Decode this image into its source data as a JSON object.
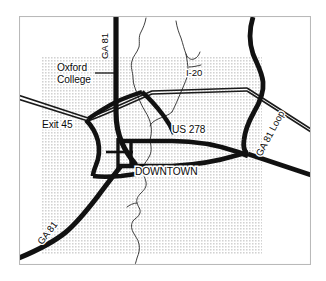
{
  "map": {
    "title": "Downtown Covington / Oxford area road map",
    "background_color": "#ffffff",
    "frame_color": "#b9b9b9",
    "urban_fill_color": "#d9d9d9",
    "road_color": "#111111",
    "river_color": "#2a2a2a",
    "labels": [
      {
        "id": "ga81-north",
        "text": "GA 81",
        "kind": "highway-shield-text",
        "x": 108,
        "y": 46,
        "rotation": -90
      },
      {
        "id": "oxford-college",
        "text": "Oxford",
        "kind": "place",
        "x": 57,
        "y": 71,
        "rotation": 0
      },
      {
        "id": "oxford-college-2",
        "text": "College",
        "kind": "place",
        "x": 57,
        "y": 83,
        "rotation": 0
      },
      {
        "id": "i20",
        "text": "I-20",
        "kind": "highway-shield-text",
        "x": 186,
        "y": 76,
        "rotation": 0
      },
      {
        "id": "exit45",
        "text": "Exit 45",
        "kind": "interchange",
        "x": 42,
        "y": 128,
        "rotation": 0
      },
      {
        "id": "us278",
        "text": "US 278",
        "kind": "highway-shield-text",
        "x": 172,
        "y": 133,
        "rotation": 0
      },
      {
        "id": "ga81-loop",
        "text": "GA 81 Loop",
        "kind": "highway-shield-text",
        "x": 273,
        "y": 135,
        "rotation": -62
      },
      {
        "id": "downtown",
        "text": "DOWNTOWN",
        "kind": "place",
        "x": 135,
        "y": 175,
        "rotation": 0
      },
      {
        "id": "ga81-south",
        "text": "GA 81",
        "kind": "highway-shield-text",
        "x": 50,
        "y": 235,
        "rotation": -52
      }
    ],
    "features": {
      "urban_area_label": "Urbanized area (stippled)",
      "rivers_label": "Streams",
      "interstate_label": "Interstate 20 (divided highway)",
      "arterials_label": "State and US highways"
    }
  }
}
